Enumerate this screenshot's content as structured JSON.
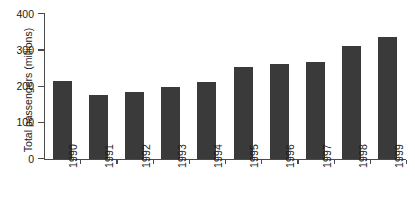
{
  "chart_data": {
    "type": "bar",
    "title": "",
    "xlabel": "",
    "ylabel": "Total passengers (millions)",
    "categories": [
      "1990",
      "1991",
      "1992",
      "1993",
      "1994",
      "1995",
      "1996",
      "1997",
      "1998",
      "1999"
    ],
    "values": [
      215,
      178,
      185,
      200,
      213,
      255,
      263,
      268,
      313,
      338
    ],
    "ylim": [
      0,
      400
    ],
    "yticks": [
      0,
      100,
      200,
      300,
      400
    ],
    "ytick_labels": [
      "0",
      "100",
      "200",
      "300",
      "400"
    ],
    "grid": false,
    "legend": null,
    "series": [
      {
        "name": "Total passengers",
        "values": [
          215,
          178,
          185,
          200,
          213,
          255,
          263,
          268,
          313,
          338
        ]
      }
    ],
    "colors": {
      "bar": "#3a3a3a",
      "axis": "#4a4a4a",
      "text": "#1a1a1a",
      "background": "#ffffff"
    }
  }
}
